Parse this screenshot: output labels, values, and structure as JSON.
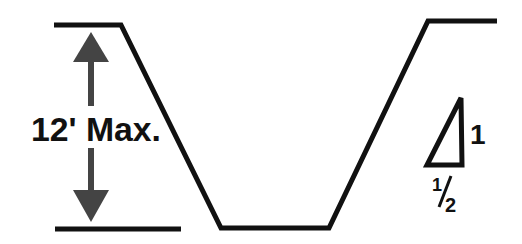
{
  "diagram": {
    "type": "trench-cross-section",
    "depth_label": "12' Max.",
    "slope": {
      "rise_label": "1",
      "run_label_numerator": "1",
      "run_label_denominator": "2"
    },
    "colors": {
      "line": "#111111",
      "arrow": "#444444",
      "background": "#ffffff"
    }
  }
}
